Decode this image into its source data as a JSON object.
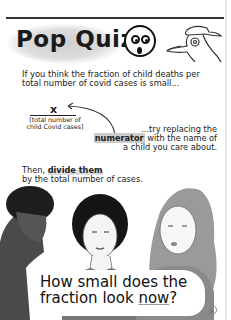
{
  "header": {
    "title": "Pop Quiz!",
    "icons": [
      "surprised-face-icon",
      "plague-doctor-icon"
    ]
  },
  "intro": {
    "line1": "If you think the fraction of child deaths per",
    "line2": "total number of covid cases is small..."
  },
  "fraction": {
    "numerator": "x",
    "denominator_line1": "[total number of",
    "denominator_line2": "child Covid cases]"
  },
  "instruction": {
    "line1": "...try replacing the",
    "line2_highlight": "numerator",
    "line2_rest": " with the name of",
    "line3": "a child you care about."
  },
  "then": {
    "line1_prefix": "Then, ",
    "line1_emphasis": "divide them",
    "line2": "by the total number of cases."
  },
  "caption": {
    "line1": "How small does the",
    "line2_prefix": "fraction look ",
    "line2_emphasis": "now",
    "line2_suffix": "?"
  },
  "signature": "♀"
}
